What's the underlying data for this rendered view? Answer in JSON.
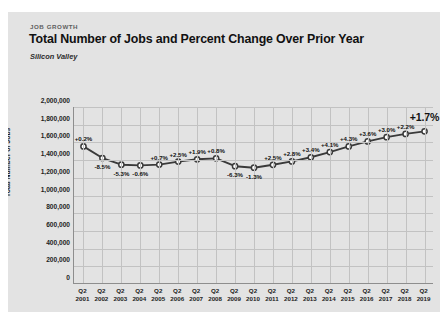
{
  "card": {
    "eyebrow": "JOB GROWTH",
    "title": "Total Number of Jobs and Percent Change Over Prior Year",
    "subtitle": "Silicon Valley"
  },
  "chart_data": {
    "type": "line",
    "title": "Total Number of Jobs and Percent Change Over Prior Year",
    "subtitle": "Silicon Valley",
    "xlabel": "",
    "ylabel": "Total Number of Jobs",
    "ylim": [
      0,
      2000000
    ],
    "grid": true,
    "legend": "none",
    "categories": [
      "Q2 2001",
      "Q2 2002",
      "Q2 2003",
      "Q2 2004",
      "Q2 2005",
      "Q2 2006",
      "Q2 2007",
      "Q2 2008",
      "Q2 2009",
      "Q2 2010",
      "Q2 2011",
      "Q2 2012",
      "Q2 2013",
      "Q2 2014",
      "Q2 2015",
      "Q2 2016",
      "Q2 2017",
      "Q2 2018",
      "Q2 2019"
    ],
    "x_tick_quarter": "Q2",
    "x_tick_years": [
      "2001",
      "2002",
      "2003",
      "2004",
      "2005",
      "2006",
      "2007",
      "2008",
      "2009",
      "2010",
      "2011",
      "2012",
      "2013",
      "2014",
      "2015",
      "2016",
      "2017",
      "2018",
      "2019"
    ],
    "y_ticks": [
      "0",
      "200,000",
      "400,000",
      "600,000",
      "800,000",
      "1,000,000",
      "1,200,000",
      "1,400,000",
      "1,600,000",
      "1,800,000",
      "2,000,000"
    ],
    "y_tick_values": [
      0,
      200000,
      400000,
      600000,
      800000,
      1000000,
      1200000,
      1400000,
      1600000,
      1800000,
      2000000
    ],
    "values": [
      1555000,
      1423000,
      1348000,
      1340000,
      1349000,
      1383000,
      1409000,
      1420000,
      1331000,
      1314000,
      1347000,
      1385000,
      1432000,
      1491000,
      1555000,
      1611000,
      1659000,
      1696000,
      1725000
    ],
    "point_labels": [
      "+0.2%",
      "-8.5%",
      "-5.3%",
      "-0.6%",
      "+0.7%",
      "+2.5%",
      "+1.9%",
      "+0.8%",
      "-6.3%",
      "-1.3%",
      "+2.5%",
      "+2.8%",
      "+3.4%",
      "+4.1%",
      "+4.3%",
      "+3.6%",
      "+3.0%",
      "+2.2%",
      "+1.7%"
    ],
    "point_label_positions": [
      "above",
      "below",
      "below",
      "below",
      "above",
      "above",
      "above",
      "above",
      "below",
      "below",
      "above",
      "above",
      "above",
      "above",
      "above",
      "above",
      "above",
      "above",
      "above"
    ],
    "highlight_label": "+1.7%",
    "series_color": "#3a3a3a",
    "marker_fill": "#ffffff",
    "grid_color": "#c2c2c2",
    "card_background": "#e3e3e3"
  }
}
